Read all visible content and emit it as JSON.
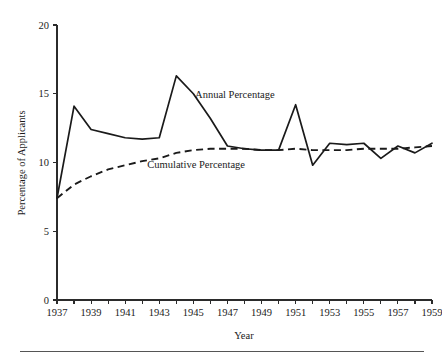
{
  "chart_data": {
    "type": "line",
    "title": "",
    "xlabel": "Year",
    "ylabel": "Percentage of Applicants",
    "xlim": [
      1937,
      1959
    ],
    "ylim": [
      0,
      20
    ],
    "grid": false,
    "legend_position": "inline-annotation",
    "y_ticks": [
      0,
      5,
      10,
      15,
      20
    ],
    "y_tick_labels": [
      "0",
      "5",
      "10",
      "15",
      "20"
    ],
    "x_ticks": [
      1937,
      1938,
      1939,
      1940,
      1941,
      1942,
      1943,
      1944,
      1945,
      1946,
      1947,
      1948,
      1949,
      1950,
      1951,
      1952,
      1953,
      1954,
      1955,
      1956,
      1957,
      1958,
      1959
    ],
    "x_tick_labels": [
      "1937",
      "",
      "1939",
      "",
      "1941",
      "",
      "1943",
      "",
      "1945",
      "",
      "1947",
      "",
      "1949",
      "",
      "1951",
      "",
      "1953",
      "",
      "1955",
      "",
      "1957",
      "",
      "1959"
    ],
    "x": [
      1937,
      1938,
      1939,
      1940,
      1941,
      1942,
      1943,
      1944,
      1945,
      1946,
      1947,
      1948,
      1949,
      1950,
      1951,
      1952,
      1953,
      1954,
      1955,
      1956,
      1957,
      1958,
      1959
    ],
    "series": [
      {
        "name": "Annual Percentage",
        "style": "solid",
        "values": [
          7.4,
          14.1,
          12.4,
          12.1,
          11.8,
          11.7,
          11.8,
          16.3,
          15.0,
          13.2,
          11.2,
          11.0,
          10.9,
          10.9,
          14.2,
          9.8,
          11.4,
          11.3,
          11.4,
          10.3,
          11.2,
          10.7,
          11.4
        ]
      },
      {
        "name": "Cumulative Percentage",
        "style": "dashed",
        "values": [
          7.4,
          8.4,
          9.0,
          9.5,
          9.8,
          10.1,
          10.3,
          10.7,
          10.9,
          11.0,
          11.0,
          11.0,
          10.9,
          10.9,
          11.0,
          10.9,
          10.9,
          10.9,
          11.0,
          11.0,
          11.0,
          11.1,
          11.2
        ]
      }
    ],
    "annotations": [
      {
        "text": "Annual Percentage",
        "x": 1945.1,
        "y": 14.7
      },
      {
        "text": "Cumulative Percentage",
        "x": 1942.3,
        "y": 9.6
      }
    ]
  },
  "figure": {
    "footer_rule": true
  }
}
